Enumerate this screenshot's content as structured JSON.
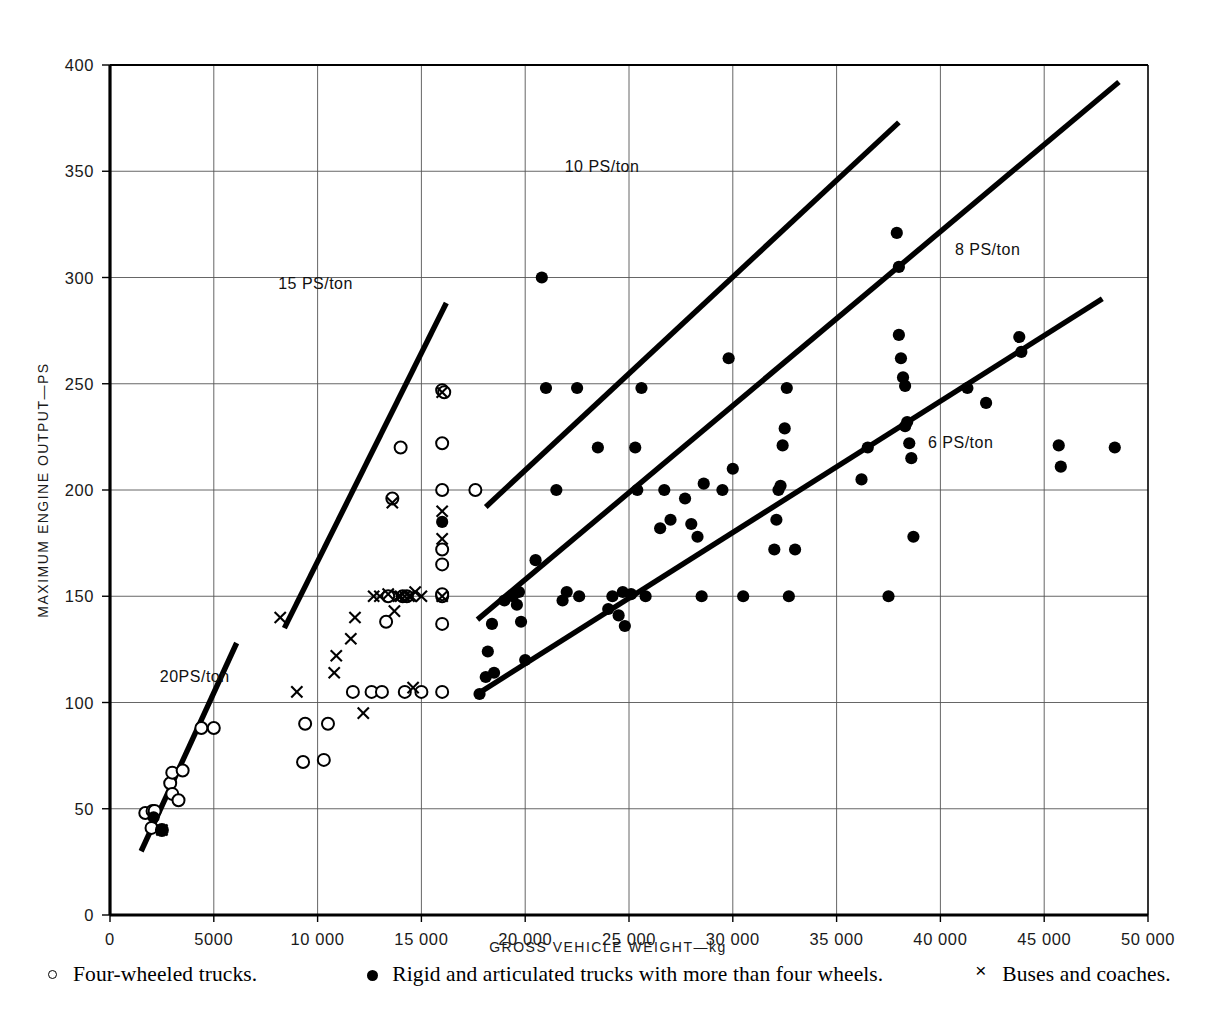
{
  "chart_data": {
    "type": "scatter",
    "title": "",
    "xlabel": "GROSS VEHICLE WEIGHT—kg",
    "ylabel": "MAXIMUM ENGINE OUTPUT—PS",
    "xlim": [
      0,
      50000
    ],
    "ylim": [
      0,
      400
    ],
    "xticks": [
      0,
      5000,
      10000,
      15000,
      20000,
      25000,
      30000,
      35000,
      40000,
      45000,
      50000
    ],
    "xtick_labels": [
      "0",
      "5000",
      "10 000",
      "15 000",
      "20 000",
      "25 000",
      "30 000",
      "35 000",
      "40 000",
      "45 000",
      "50 000"
    ],
    "yticks": [
      0,
      50,
      100,
      150,
      200,
      250,
      300,
      350,
      400
    ],
    "ytick_labels": [
      "0",
      "50",
      "100",
      "150",
      "200",
      "250",
      "300",
      "350",
      "400"
    ],
    "grid": true,
    "legend_position": "below",
    "series": [
      {
        "name": "Four-wheeled trucks.",
        "marker": "open-circle",
        "color": "#000000",
        "points": [
          [
            1700,
            48
          ],
          [
            2000,
            41
          ],
          [
            2050,
            49
          ],
          [
            2150,
            49
          ],
          [
            2500,
            40
          ],
          [
            2900,
            62
          ],
          [
            3000,
            67
          ],
          [
            3000,
            57
          ],
          [
            3300,
            54
          ],
          [
            3500,
            68
          ],
          [
            4400,
            88
          ],
          [
            5000,
            88
          ],
          [
            9300,
            72
          ],
          [
            9400,
            90
          ],
          [
            10300,
            73
          ],
          [
            10500,
            90
          ],
          [
            11700,
            105
          ],
          [
            12600,
            105
          ],
          [
            13100,
            105
          ],
          [
            13300,
            138
          ],
          [
            13400,
            150
          ],
          [
            13600,
            196
          ],
          [
            14000,
            220
          ],
          [
            14100,
            150
          ],
          [
            14200,
            105
          ],
          [
            14300,
            150
          ],
          [
            15000,
            105
          ],
          [
            16000,
            105
          ],
          [
            16000,
            137
          ],
          [
            16000,
            150
          ],
          [
            16000,
            151
          ],
          [
            16000,
            165
          ],
          [
            16000,
            172
          ],
          [
            16000,
            200
          ],
          [
            16000,
            222
          ],
          [
            16000,
            247
          ],
          [
            16100,
            246
          ],
          [
            17600,
            200
          ]
        ]
      },
      {
        "name": "Rigid and articulated trucks with more than four wheels.",
        "marker": "filled-circle",
        "color": "#000000",
        "points": [
          [
            2500,
            40
          ],
          [
            2100,
            46
          ],
          [
            16000,
            185
          ],
          [
            17800,
            104
          ],
          [
            18100,
            112
          ],
          [
            18200,
            124
          ],
          [
            18400,
            137
          ],
          [
            18500,
            114
          ],
          [
            19000,
            148
          ],
          [
            19400,
            150
          ],
          [
            19600,
            146
          ],
          [
            19700,
            152
          ],
          [
            19800,
            138
          ],
          [
            20000,
            120
          ],
          [
            20500,
            167
          ],
          [
            20800,
            300
          ],
          [
            21000,
            248
          ],
          [
            21500,
            200
          ],
          [
            21800,
            148
          ],
          [
            22000,
            152
          ],
          [
            22500,
            248
          ],
          [
            22600,
            150
          ],
          [
            23500,
            220
          ],
          [
            24000,
            144
          ],
          [
            24200,
            150
          ],
          [
            24500,
            141
          ],
          [
            24700,
            152
          ],
          [
            24800,
            136
          ],
          [
            25100,
            151
          ],
          [
            25300,
            220
          ],
          [
            25400,
            200
          ],
          [
            25600,
            248
          ],
          [
            25800,
            150
          ],
          [
            26500,
            182
          ],
          [
            26700,
            200
          ],
          [
            27000,
            186
          ],
          [
            27700,
            196
          ],
          [
            28000,
            184
          ],
          [
            28300,
            178
          ],
          [
            28500,
            150
          ],
          [
            28600,
            203
          ],
          [
            29500,
            200
          ],
          [
            29800,
            262
          ],
          [
            30000,
            210
          ],
          [
            30500,
            150
          ],
          [
            32000,
            172
          ],
          [
            32100,
            186
          ],
          [
            32200,
            200
          ],
          [
            32300,
            202
          ],
          [
            32400,
            221
          ],
          [
            32500,
            229
          ],
          [
            32600,
            248
          ],
          [
            32700,
            150
          ],
          [
            33000,
            172
          ],
          [
            36200,
            205
          ],
          [
            36500,
            220
          ],
          [
            37500,
            150
          ],
          [
            37900,
            321
          ],
          [
            38000,
            305
          ],
          [
            38000,
            273
          ],
          [
            38100,
            262
          ],
          [
            38200,
            253
          ],
          [
            38300,
            249
          ],
          [
            38300,
            230
          ],
          [
            38400,
            232
          ],
          [
            38500,
            222
          ],
          [
            38600,
            215
          ],
          [
            38700,
            178
          ],
          [
            41300,
            248
          ],
          [
            42200,
            241
          ],
          [
            43800,
            272
          ],
          [
            43900,
            265
          ],
          [
            45700,
            221
          ],
          [
            45800,
            211
          ],
          [
            48400,
            220
          ]
        ]
      },
      {
        "name": "Buses and coaches.",
        "marker": "cross",
        "color": "#000000",
        "points": [
          [
            2500,
            40
          ],
          [
            9000,
            105
          ],
          [
            10800,
            114
          ],
          [
            10900,
            122
          ],
          [
            11600,
            130
          ],
          [
            11800,
            140
          ],
          [
            12200,
            95
          ],
          [
            12700,
            150
          ],
          [
            13000,
            150
          ],
          [
            13400,
            151
          ],
          [
            13600,
            194
          ],
          [
            13700,
            143
          ],
          [
            13900,
            150
          ],
          [
            14000,
            150
          ],
          [
            14200,
            150
          ],
          [
            14400,
            150
          ],
          [
            14500,
            150
          ],
          [
            14600,
            107
          ],
          [
            14700,
            152
          ],
          [
            15000,
            150
          ],
          [
            16000,
            150
          ],
          [
            16000,
            177
          ],
          [
            16000,
            190
          ],
          [
            16000,
            246
          ],
          [
            8200,
            140
          ]
        ]
      }
    ],
    "reference_lines": [
      {
        "label": "20PS/ton",
        "ps_per_ton": 20,
        "label_x": 2400,
        "label_y": 112,
        "x_start": 1500,
        "y_start": 30,
        "x_end": 6100,
        "y_end": 128
      },
      {
        "label": "15 PS/ton",
        "ps_per_ton": 15,
        "label_x": 8100,
        "label_y": 297,
        "x_start": 8400,
        "y_start": 135,
        "x_end": 16200,
        "y_end": 288
      },
      {
        "label": "10 PS/ton",
        "ps_per_ton": 10,
        "label_x": 21900,
        "label_y": 352,
        "x_start": 18100,
        "y_start": 192,
        "x_end": 38000,
        "y_end": 373
      },
      {
        "label": "8 PS/ton",
        "ps_per_ton": 8,
        "label_x": 40700,
        "label_y": 313,
        "x_start": 17700,
        "y_start": 139,
        "x_end": 48600,
        "y_end": 392
      },
      {
        "label": "6 PS/ton",
        "ps_per_ton": 6,
        "label_x": 39400,
        "label_y": 222,
        "x_start": 17700,
        "y_start": 104,
        "x_end": 47800,
        "y_end": 290
      }
    ]
  },
  "axes": {
    "x_title": "GROSS VEHICLE WEIGHT—kg",
    "y_title": "MAXIMUM ENGINE OUTPUT—PS"
  },
  "legend": {
    "items": [
      {
        "marker": "open-circle",
        "label": "Four-wheeled trucks."
      },
      {
        "marker": "filled-circle",
        "label": "Rigid and articulated trucks with more than four wheels."
      },
      {
        "marker": "cross",
        "label": "Buses and coaches."
      }
    ]
  }
}
